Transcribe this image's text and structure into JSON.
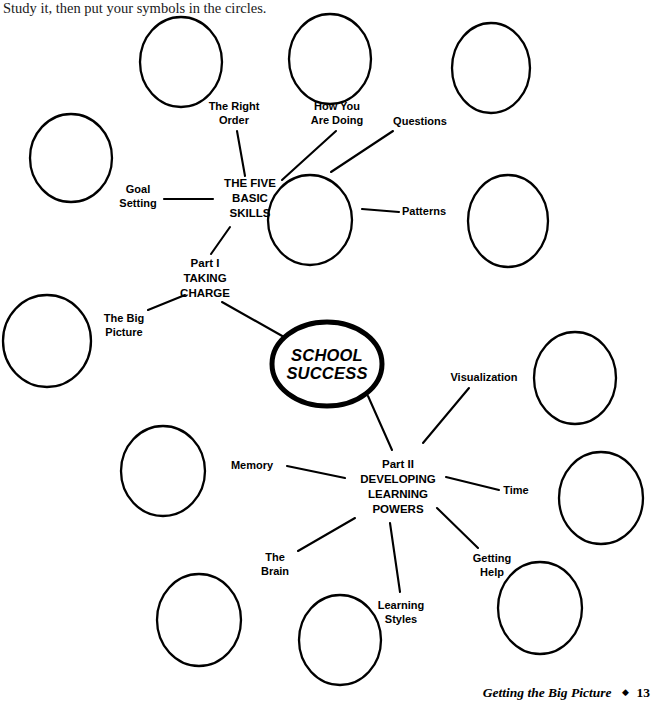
{
  "intro": {
    "text": "Study it, then put your symbols in the circles."
  },
  "center": {
    "label": "SCHOOL\nSUCCESS"
  },
  "hubs": [
    {
      "name": "five-basic-skills",
      "label": "THE FIVE\nBASIC\nSKILLS",
      "x": 250,
      "y": 198
    },
    {
      "name": "part-one-taking-charge",
      "label": "Part I\nTAKING\nCHARGE",
      "x": 205,
      "y": 278
    },
    {
      "name": "part-two-developing-learning-powers",
      "label": "Part II\nDEVELOPING\nLEARNING\nPOWERS",
      "x": 398,
      "y": 487
    }
  ],
  "branch_labels": [
    {
      "name": "the-right-order",
      "label": "The Right\nOrder",
      "x": 234,
      "y": 113
    },
    {
      "name": "how-you-are-doing",
      "label": "How You\nAre Doing",
      "x": 337,
      "y": 113
    },
    {
      "name": "questions",
      "label": "Questions",
      "x": 420,
      "y": 122
    },
    {
      "name": "goal-setting",
      "label": "Goal\nSetting",
      "x": 138,
      "y": 196
    },
    {
      "name": "patterns",
      "label": "Patterns",
      "x": 424,
      "y": 212
    },
    {
      "name": "the-big-picture",
      "label": "The Big\nPicture",
      "x": 124,
      "y": 325
    },
    {
      "name": "visualization",
      "label": "Visualization",
      "x": 484,
      "y": 378
    },
    {
      "name": "memory",
      "label": "Memory",
      "x": 252,
      "y": 466
    },
    {
      "name": "time",
      "label": "Time",
      "x": 516,
      "y": 491
    },
    {
      "name": "the-brain",
      "label": "The\nBrain",
      "x": 275,
      "y": 564
    },
    {
      "name": "getting-help",
      "label": "Getting\nHelp",
      "x": 492,
      "y": 565
    },
    {
      "name": "learning-styles",
      "label": "Learning\nStyles",
      "x": 401,
      "y": 612
    }
  ],
  "empty_circles": [
    {
      "name": "circle-the-right-order",
      "cx": 181,
      "cy": 62,
      "rx": 41,
      "ry": 45
    },
    {
      "name": "circle-how-you-are-doing",
      "cx": 330,
      "cy": 59,
      "rx": 41,
      "ry": 45
    },
    {
      "name": "circle-questions",
      "cx": 491,
      "cy": 68,
      "rx": 39,
      "ry": 45
    },
    {
      "name": "circle-goal-setting",
      "cx": 71,
      "cy": 158,
      "rx": 41,
      "ry": 44
    },
    {
      "name": "circle-patterns",
      "cx": 508,
      "cy": 221,
      "rx": 40,
      "ry": 46
    },
    {
      "name": "circle-five-basic-skills",
      "cx": 310,
      "cy": 220,
      "rx": 42,
      "ry": 45
    },
    {
      "name": "circle-the-big-picture",
      "cx": 47,
      "cy": 341,
      "rx": 44,
      "ry": 46
    },
    {
      "name": "circle-visualization",
      "cx": 575,
      "cy": 378,
      "rx": 41,
      "ry": 46
    },
    {
      "name": "circle-memory",
      "cx": 163,
      "cy": 471,
      "rx": 42,
      "ry": 45
    },
    {
      "name": "circle-time",
      "cx": 601,
      "cy": 498,
      "rx": 42,
      "ry": 46
    },
    {
      "name": "circle-the-brain",
      "cx": 199,
      "cy": 620,
      "rx": 42,
      "ry": 46
    },
    {
      "name": "circle-getting-help",
      "cx": 540,
      "cy": 608,
      "rx": 42,
      "ry": 46
    },
    {
      "name": "circle-learning-styles",
      "cx": 340,
      "cy": 640,
      "rx": 41,
      "ry": 45
    }
  ],
  "connectors": [
    {
      "name": "connector-right-order",
      "x1": 237,
      "y1": 131,
      "x2": 245,
      "y2": 176
    },
    {
      "name": "connector-how-you-are-doing",
      "x1": 336,
      "y1": 131,
      "x2": 282,
      "y2": 180
    },
    {
      "name": "connector-questions",
      "x1": 393,
      "y1": 131,
      "x2": 331,
      "y2": 172
    },
    {
      "name": "connector-goal-setting",
      "x1": 164,
      "y1": 199,
      "x2": 213,
      "y2": 199
    },
    {
      "name": "connector-patterns",
      "x1": 399,
      "y1": 212,
      "x2": 362,
      "y2": 209
    },
    {
      "name": "connector-skills-to-part-one",
      "x1": 230,
      "y1": 227,
      "x2": 211,
      "y2": 254
    },
    {
      "name": "connector-big-picture",
      "x1": 148,
      "y1": 310,
      "x2": 185,
      "y2": 295
    },
    {
      "name": "connector-part-one-to-center",
      "x1": 222,
      "y1": 302,
      "x2": 284,
      "y2": 337
    },
    {
      "name": "connector-center-to-part-two",
      "x1": 368,
      "y1": 396,
      "x2": 392,
      "y2": 450
    },
    {
      "name": "connector-visualization",
      "x1": 469,
      "y1": 388,
      "x2": 423,
      "y2": 443
    },
    {
      "name": "connector-memory",
      "x1": 287,
      "y1": 466,
      "x2": 345,
      "y2": 478
    },
    {
      "name": "connector-time",
      "x1": 499,
      "y1": 490,
      "x2": 446,
      "y2": 477
    },
    {
      "name": "connector-brain",
      "x1": 298,
      "y1": 551,
      "x2": 355,
      "y2": 518
    },
    {
      "name": "connector-getting-help",
      "x1": 478,
      "y1": 548,
      "x2": 437,
      "y2": 508
    },
    {
      "name": "connector-learning-styles",
      "x1": 400,
      "y1": 592,
      "x2": 390,
      "y2": 523
    }
  ],
  "footer": {
    "title": "Getting the Big Picture",
    "separator": "◆",
    "page": "13"
  },
  "colors": {
    "ink": "#000000",
    "paper": "#ffffff"
  }
}
